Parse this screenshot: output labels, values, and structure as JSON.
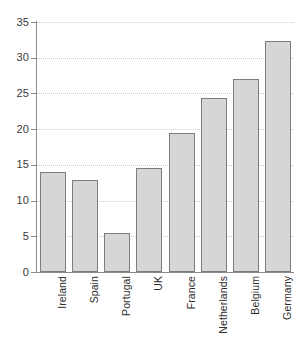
{
  "chart_data": {
    "type": "bar",
    "title": "",
    "subtitle": "",
    "xlabel": "",
    "ylabel": "",
    "categories": [
      "Ireland",
      "Spain",
      "Portugal",
      "UK",
      "France",
      "Netherlands",
      "Belgium",
      "Germany"
    ],
    "values": [
      14.0,
      12.9,
      5.5,
      14.6,
      19.5,
      24.4,
      27.0,
      32.4
    ],
    "ylim": [
      0,
      35
    ],
    "xlim_categorical": true,
    "y_ticks": [
      0,
      5,
      10,
      15,
      20,
      25,
      30,
      35
    ],
    "y_tick_labels": [
      "0",
      "5",
      "10",
      "15",
      "20",
      "25",
      "30",
      "35"
    ],
    "grid": "horizontal-dotted",
    "legend": null,
    "legend_position": "none",
    "annotations": [],
    "bar_fill_color": "#d6d6d6",
    "bar_border_color": "#7d7d7d",
    "axis_color": "#8a8a8a",
    "gridline_color": "#c9c9cf",
    "background_color": "#ffffff",
    "x_tick_label_rotation": 90
  }
}
